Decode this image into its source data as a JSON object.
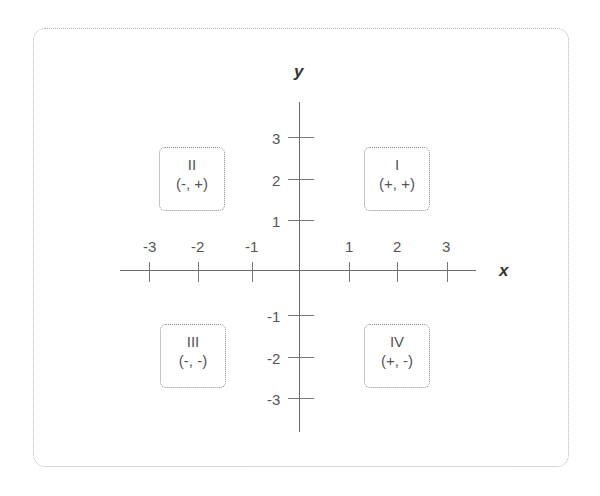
{
  "diagram": {
    "axes": {
      "x_label": "x",
      "y_label": "y",
      "x_ticks": [
        "-3",
        "-2",
        "-1",
        "1",
        "2",
        "3"
      ],
      "y_ticks": [
        "3",
        "2",
        "1",
        "-1",
        "-2",
        "-3"
      ]
    },
    "quadrants": [
      {
        "numeral": "I",
        "signs": "(+, +)"
      },
      {
        "numeral": "II",
        "signs": "(-, +)"
      },
      {
        "numeral": "III",
        "signs": "(-, -)"
      },
      {
        "numeral": "IV",
        "signs": "(+, -)"
      }
    ]
  }
}
